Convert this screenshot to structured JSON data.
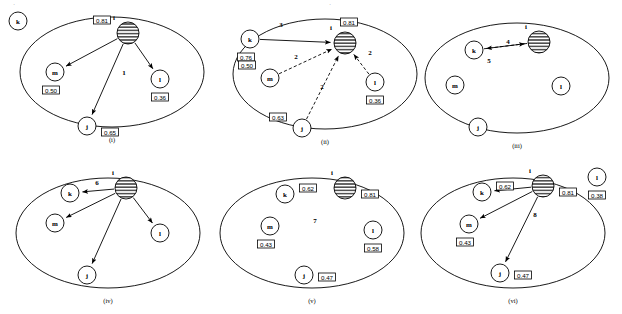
{
  "figure": {
    "title_mark": "",
    "width": 622,
    "height": 314,
    "stroke_color": "#000000",
    "background_color": "#ffffff"
  },
  "panels": [
    {
      "id": "panel-i",
      "caption": "(i)",
      "ellipse": {
        "cx": 112,
        "cy": 72,
        "rx": 92,
        "ry": 55
      },
      "nodes": [
        {
          "name": "k",
          "label": "k",
          "cx": 18,
          "cy": 21,
          "r": 9,
          "style": "plain",
          "inside": false,
          "value": null,
          "value_pos": null
        },
        {
          "name": "i",
          "label": "i",
          "cx": 128,
          "cy": 33,
          "r": 11,
          "style": "hatched",
          "inside": true,
          "value": "0.81",
          "value_pos": "left-above",
          "name_pos": "above-left"
        },
        {
          "name": "m",
          "label": "m",
          "cx": 55,
          "cy": 72,
          "r": 9,
          "style": "plain",
          "inside": true,
          "value": "0.50",
          "value_pos": "below-left"
        },
        {
          "name": "l",
          "label": "l",
          "cx": 160,
          "cy": 79,
          "r": 9,
          "style": "plain",
          "inside": true,
          "value": "0.36",
          "value_pos": "below"
        },
        {
          "name": "j",
          "label": "j",
          "cx": 87,
          "cy": 126,
          "r": 9,
          "style": "plain",
          "inside": true,
          "value": "0.65",
          "value_pos": "right-below"
        }
      ],
      "edges": [
        {
          "from": "i",
          "to": "m",
          "style": "solid",
          "arrow": true,
          "label": null
        },
        {
          "from": "i",
          "to": "l",
          "style": "solid",
          "arrow": true,
          "label": null
        },
        {
          "from": "i",
          "to": "j",
          "style": "solid",
          "arrow": true,
          "label": "1",
          "label_x": 124,
          "label_y": 73
        }
      ]
    },
    {
      "id": "panel-ii",
      "caption": "(ii)",
      "ellipse": {
        "cx": 325,
        "cy": 74,
        "rx": 92,
        "ry": 55
      },
      "nodes": [
        {
          "name": "k",
          "label": "k",
          "cx": 250,
          "cy": 39,
          "r": 9,
          "style": "plain",
          "inside": false,
          "value": "0.76",
          "value_pos": "below-left"
        },
        {
          "name": "i",
          "label": "i",
          "cx": 345,
          "cy": 43,
          "r": 11,
          "style": "hatched",
          "inside": true,
          "value": "0.81",
          "value_pos": "above",
          "name_pos": "above-left"
        },
        {
          "name": "m",
          "label": "m",
          "cx": 270,
          "cy": 78,
          "r": 9,
          "style": "plain",
          "inside": true,
          "value": "0.50",
          "value_pos": "above-left"
        },
        {
          "name": "l",
          "label": "l",
          "cx": 375,
          "cy": 82,
          "r": 9,
          "style": "plain",
          "inside": true,
          "value": "0.36",
          "value_pos": "below"
        },
        {
          "name": "j",
          "label": "j",
          "cx": 302,
          "cy": 128,
          "r": 9,
          "style": "plain",
          "inside": true,
          "value": "0.63",
          "value_pos": "left-above"
        }
      ],
      "edges": [
        {
          "from": "k",
          "to": "i",
          "style": "solid",
          "arrow": true,
          "label": "3",
          "label_x": 281,
          "label_y": 25
        },
        {
          "from": "m",
          "to": "i",
          "style": "dashed",
          "arrow": true,
          "label": "2",
          "label_x": 296,
          "label_y": 57
        },
        {
          "from": "j",
          "to": "i",
          "style": "dashed",
          "arrow": true,
          "label": "2",
          "label_x": 322,
          "label_y": 87
        },
        {
          "from": "l",
          "to": "i",
          "style": "dashed",
          "arrow": true,
          "label": "2",
          "label_x": 370,
          "label_y": 53
        }
      ]
    },
    {
      "id": "panel-iii",
      "caption": "(iii)",
      "ellipse": {
        "cx": 517,
        "cy": 78,
        "rx": 92,
        "ry": 55
      },
      "nodes": [
        {
          "name": "k",
          "label": "k",
          "cx": 474,
          "cy": 50,
          "r": 9,
          "style": "plain",
          "inside": true,
          "value": null
        },
        {
          "name": "i",
          "label": "i",
          "cx": 539,
          "cy": 42,
          "r": 11,
          "style": "hatched",
          "inside": true,
          "value": null,
          "name_pos": "above"
        },
        {
          "name": "m",
          "label": "m",
          "cx": 455,
          "cy": 85,
          "r": 9,
          "style": "plain",
          "inside": true,
          "value": null
        },
        {
          "name": "l",
          "label": "l",
          "cx": 561,
          "cy": 86,
          "r": 9,
          "style": "plain",
          "inside": true,
          "value": null
        },
        {
          "name": "j",
          "label": "j",
          "cx": 478,
          "cy": 127,
          "r": 9,
          "style": "plain",
          "inside": true,
          "value": null
        }
      ],
      "edges": [
        {
          "from": "i",
          "to": "k",
          "style": "solid",
          "arrow": true,
          "label": "4",
          "label_x": 508,
          "label_y": 42
        },
        {
          "from": "k",
          "to": "i",
          "style": "dashed",
          "arrow": true,
          "label": "5",
          "label_x": 489,
          "label_y": 61
        }
      ]
    },
    {
      "id": "panel-iv",
      "caption": "(iv)",
      "ellipse": {
        "cx": 108,
        "cy": 233,
        "rx": 92,
        "ry": 55
      },
      "nodes": [
        {
          "name": "k",
          "label": "k",
          "cx": 70,
          "cy": 193,
          "r": 9,
          "style": "plain",
          "inside": true,
          "value": null
        },
        {
          "name": "i",
          "label": "i",
          "cx": 126,
          "cy": 188,
          "r": 11,
          "style": "hatched",
          "inside": true,
          "value": null,
          "name_pos": "above"
        },
        {
          "name": "m",
          "label": "m",
          "cx": 55,
          "cy": 223,
          "r": 9,
          "style": "plain",
          "inside": true,
          "value": null
        },
        {
          "name": "l",
          "label": "l",
          "cx": 160,
          "cy": 233,
          "r": 9,
          "style": "plain",
          "inside": true,
          "value": null
        },
        {
          "name": "j",
          "label": "j",
          "cx": 87,
          "cy": 275,
          "r": 9,
          "style": "plain",
          "inside": true,
          "value": null
        }
      ],
      "edges": [
        {
          "from": "i",
          "to": "k",
          "style": "solid",
          "arrow": true,
          "label": "6",
          "label_x": 97,
          "label_y": 183
        },
        {
          "from": "i",
          "to": "m",
          "style": "solid",
          "arrow": true,
          "label": null
        },
        {
          "from": "i",
          "to": "l",
          "style": "solid",
          "arrow": true,
          "label": null
        },
        {
          "from": "i",
          "to": "j",
          "style": "solid",
          "arrow": true,
          "label": null
        }
      ]
    },
    {
      "id": "panel-v",
      "caption": "(v)",
      "ellipse": {
        "cx": 312,
        "cy": 233,
        "rx": 92,
        "ry": 55
      },
      "center_label": "7",
      "center_label_x": 315,
      "center_label_y": 221,
      "nodes": [
        {
          "name": "k",
          "label": "k",
          "cx": 285,
          "cy": 194,
          "r": 9,
          "style": "plain",
          "inside": true,
          "value": "0.62",
          "value_pos": "right-above"
        },
        {
          "name": "i",
          "label": "i",
          "cx": 345,
          "cy": 188,
          "r": 11,
          "style": "hatched",
          "inside": true,
          "value": "0.81",
          "value_pos": "right-below",
          "name_pos": "above"
        },
        {
          "name": "m",
          "label": "m",
          "cx": 270,
          "cy": 226,
          "r": 9,
          "style": "plain",
          "inside": true,
          "value": "0.43",
          "value_pos": "below-left"
        },
        {
          "name": "l",
          "label": "l",
          "cx": 373,
          "cy": 230,
          "r": 9,
          "style": "plain",
          "inside": true,
          "value": "0.58",
          "value_pos": "below"
        },
        {
          "name": "j",
          "label": "j",
          "cx": 304,
          "cy": 275,
          "r": 9,
          "style": "plain",
          "inside": true,
          "value": "0.47",
          "value_pos": "right"
        }
      ],
      "edges": []
    },
    {
      "id": "panel-vi",
      "caption": "(vi)",
      "ellipse": {
        "cx": 513,
        "cy": 233,
        "rx": 92,
        "ry": 55
      },
      "center_label": "8",
      "center_label_x": 535,
      "center_label_y": 215,
      "nodes": [
        {
          "name": "k",
          "label": "k",
          "cx": 482,
          "cy": 192,
          "r": 9,
          "style": "plain",
          "inside": true,
          "value": "0.62",
          "value_pos": "right-above"
        },
        {
          "name": "i",
          "label": "i",
          "cx": 543,
          "cy": 186,
          "r": 11,
          "style": "hatched",
          "inside": true,
          "value": "0.81",
          "value_pos": "right-below",
          "name_pos": "above"
        },
        {
          "name": "m",
          "label": "m",
          "cx": 469,
          "cy": 224,
          "r": 9,
          "style": "plain",
          "inside": true,
          "value": "0.43",
          "value_pos": "below-left"
        },
        {
          "name": "l",
          "label": "l",
          "cx": 597,
          "cy": 177,
          "r": 9,
          "style": "plain",
          "inside": false,
          "value": "0.38",
          "value_pos": "below"
        },
        {
          "name": "j",
          "label": "j",
          "cx": 500,
          "cy": 273,
          "r": 9,
          "style": "plain",
          "inside": true,
          "value": "0.47",
          "value_pos": "right"
        }
      ],
      "edges": [
        {
          "from": "i",
          "to": "k",
          "style": "solid",
          "arrow": true,
          "label": null
        },
        {
          "from": "i",
          "to": "m",
          "style": "solid",
          "arrow": true,
          "label": null
        },
        {
          "from": "i",
          "to": "j",
          "style": "solid",
          "arrow": true,
          "label": null
        }
      ]
    }
  ],
  "captions": {
    "i": "(i)",
    "ii": "(ii)",
    "iii": "(iii)",
    "iv": "(iv)",
    "v": "(v)",
    "vi": "(vi)"
  }
}
